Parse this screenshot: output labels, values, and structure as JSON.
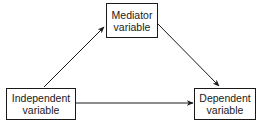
{
  "diagram": {
    "type": "mediation-model",
    "nodes": {
      "mediator": {
        "line1": "Mediator",
        "line2": "variable"
      },
      "independent": {
        "line1": "Independent",
        "line2": "variable"
      },
      "dependent": {
        "line1": "Dependent",
        "line2": "variable"
      }
    },
    "edges": [
      {
        "from": "independent",
        "to": "mediator"
      },
      {
        "from": "mediator",
        "to": "dependent"
      },
      {
        "from": "independent",
        "to": "dependent"
      }
    ],
    "colors": {
      "stroke": "#1a1a1a",
      "background": "#ffffff"
    }
  }
}
